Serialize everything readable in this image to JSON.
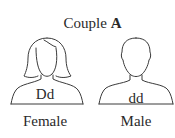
{
  "title": {
    "prefix": "Couple ",
    "letter": "A"
  },
  "persons": [
    {
      "sex": "Female",
      "genotype": "Dd",
      "icon": "female-silhouette-icon"
    },
    {
      "sex": "Male",
      "genotype": "dd",
      "icon": "male-silhouette-icon"
    }
  ],
  "colors": {
    "line": "#3a3a3a",
    "text": "#2a2a2a",
    "background": "#ffffff"
  }
}
